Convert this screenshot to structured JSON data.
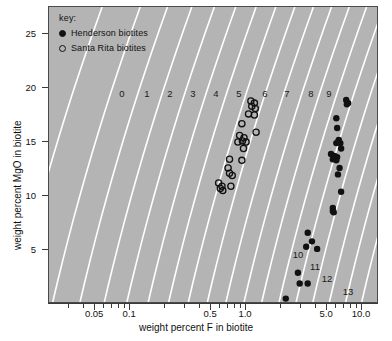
{
  "figure": {
    "xlabel": "weight percent F in biotite",
    "ylabel": "weight percent MgO in biotite",
    "background_color": "#b4b4b4",
    "contour_color": "#ffffff",
    "marker_color": "#111111"
  },
  "legend": {
    "title": "key:",
    "entries": [
      {
        "marker": "filled-circle",
        "label": "Henderson biotites"
      },
      {
        "marker": "open-circle",
        "label": "Santa Rita biotites"
      }
    ]
  },
  "axes": {
    "x_ticks_labeled": [
      "0.05",
      "0.1",
      "0.5",
      "1.0",
      "5.0",
      "10.0"
    ],
    "x_tick_values": [
      0.05,
      0.1,
      0.5,
      1.0,
      5.0,
      10.0
    ],
    "y_ticks_labeled": [
      "5",
      "10",
      "15",
      "20",
      "25"
    ],
    "y_tick_values": [
      5,
      10,
      15,
      20,
      25
    ],
    "x_scale": "log",
    "y_scale": "linear",
    "xlim": [
      0.02,
      14
    ],
    "ylim": [
      0,
      27.5
    ]
  },
  "contour_labels": [
    {
      "text": "0",
      "x": 122,
      "y": 93
    },
    {
      "text": "1",
      "x": 147,
      "y": 93
    },
    {
      "text": "2",
      "x": 170,
      "y": 93
    },
    {
      "text": "3",
      "x": 193,
      "y": 93
    },
    {
      "text": "4",
      "x": 216,
      "y": 93
    },
    {
      "text": "5",
      "x": 239,
      "y": 93
    },
    {
      "text": "6",
      "x": 265,
      "y": 93
    },
    {
      "text": "7",
      "x": 287,
      "y": 93
    },
    {
      "text": "8",
      "x": 311,
      "y": 93
    },
    {
      "text": "9",
      "x": 329,
      "y": 93
    },
    {
      "text": "10",
      "x": 298,
      "y": 254
    },
    {
      "text": "11",
      "x": 315,
      "y": 266
    },
    {
      "text": "12",
      "x": 327,
      "y": 278
    },
    {
      "text": "13",
      "x": 348,
      "y": 291
    }
  ],
  "chart_data": {
    "type": "scatter",
    "title": "",
    "xlabel": "weight percent F in biotite",
    "ylabel": "weight percent MgO in biotite",
    "x_scale": "log",
    "y_scale": "linear",
    "xlim": [
      0.02,
      14
    ],
    "ylim": [
      0,
      27.5
    ],
    "grid": false,
    "legend_position": "top-left-inside",
    "annotations": [
      "0",
      "1",
      "2",
      "3",
      "4",
      "5",
      "6",
      "7",
      "8",
      "9",
      "10",
      "11",
      "12",
      "13"
    ],
    "annotation_note": "white diagonal contour lines labeled 0-13 (log fF2O/fH2O or X-F intercept contours)",
    "series": [
      {
        "name": "Santa Rita biotites",
        "marker": "open-circle",
        "points": [
          [
            1.1,
            18.8
          ],
          [
            1.18,
            18.6
          ],
          [
            1.12,
            18.3
          ],
          [
            1.2,
            18.1
          ],
          [
            1.05,
            17.6
          ],
          [
            1.18,
            17.5
          ],
          [
            0.92,
            16.7
          ],
          [
            1.22,
            15.9
          ],
          [
            0.88,
            15.6
          ],
          [
            0.96,
            15.4
          ],
          [
            0.85,
            15.0
          ],
          [
            0.93,
            15.1
          ],
          [
            1.0,
            15.0
          ],
          [
            0.95,
            14.4
          ],
          [
            0.72,
            13.4
          ],
          [
            0.92,
            13.3
          ],
          [
            0.7,
            12.6
          ],
          [
            0.72,
            12.1
          ],
          [
            0.76,
            11.9
          ],
          [
            0.58,
            11.2
          ],
          [
            0.62,
            10.9
          ],
          [
            0.74,
            10.9
          ],
          [
            0.6,
            10.7
          ],
          [
            0.63,
            10.5
          ]
        ]
      },
      {
        "name": "Henderson biotites",
        "marker": "filled-circle",
        "points": [
          [
            7.3,
            18.9
          ],
          [
            7.6,
            18.6
          ],
          [
            7.4,
            18.5
          ],
          [
            6.0,
            17.2
          ],
          [
            6.1,
            16.3
          ],
          [
            6.3,
            15.2
          ],
          [
            6.2,
            15.0
          ],
          [
            6.0,
            14.9
          ],
          [
            6.5,
            14.9
          ],
          [
            6.6,
            14.4
          ],
          [
            5.4,
            13.9
          ],
          [
            5.8,
            13.7
          ],
          [
            6.1,
            13.6
          ],
          [
            5.6,
            13.4
          ],
          [
            6.0,
            13.3
          ],
          [
            6.4,
            12.6
          ],
          [
            6.2,
            12.0
          ],
          [
            6.6,
            10.4
          ],
          [
            5.6,
            8.9
          ],
          [
            5.6,
            8.6
          ],
          [
            5.7,
            8.5
          ],
          [
            3.4,
            6.6
          ],
          [
            3.7,
            5.8
          ],
          [
            3.3,
            5.3
          ],
          [
            4.1,
            5.1
          ],
          [
            2.8,
            2.9
          ],
          [
            2.9,
            1.9
          ],
          [
            3.4,
            1.9
          ],
          [
            2.2,
            0.5
          ]
        ]
      }
    ]
  }
}
